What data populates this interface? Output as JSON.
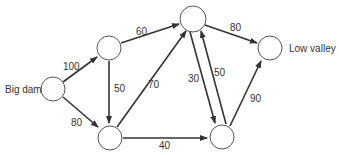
{
  "diagram": {
    "type": "network-flow",
    "nodes": [
      {
        "id": "S",
        "label": "Big dam"
      },
      {
        "id": "A",
        "label": ""
      },
      {
        "id": "B",
        "label": ""
      },
      {
        "id": "C",
        "label": ""
      },
      {
        "id": "D",
        "label": ""
      },
      {
        "id": "T",
        "label": "Low valley"
      }
    ],
    "edges": [
      {
        "from": "S",
        "to": "A",
        "capacity": "100"
      },
      {
        "from": "S",
        "to": "B",
        "capacity": "80"
      },
      {
        "from": "A",
        "to": "C",
        "capacity": "60"
      },
      {
        "from": "A",
        "to": "B",
        "capacity": "50"
      },
      {
        "from": "B",
        "to": "C",
        "capacity": "70"
      },
      {
        "from": "B",
        "to": "D",
        "capacity": "40"
      },
      {
        "from": "C",
        "to": "D",
        "capacity": "30"
      },
      {
        "from": "D",
        "to": "C",
        "capacity": "50"
      },
      {
        "from": "C",
        "to": "T",
        "capacity": "80"
      },
      {
        "from": "D",
        "to": "T",
        "capacity": "90"
      }
    ]
  }
}
